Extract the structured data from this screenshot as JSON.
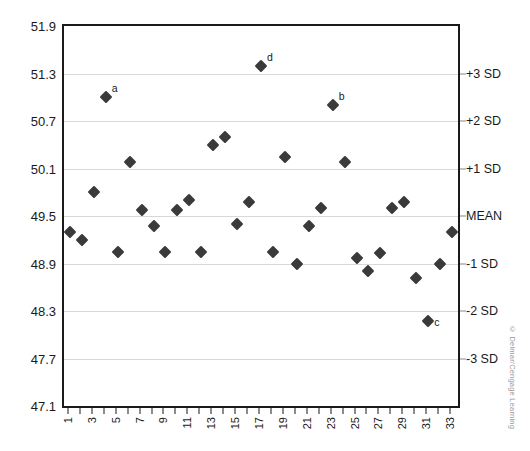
{
  "chart_data": {
    "type": "scatter",
    "title": "",
    "subtitle": "",
    "xlabel": "",
    "ylabel": "",
    "grid": true,
    "legend_position": "none",
    "xlim": [
      0.5,
      33.5
    ],
    "ylim": [
      47.1,
      51.9
    ],
    "y_left_ticks": [
      "51.9",
      "51.3",
      "50.7",
      "50.1",
      "49.5",
      "48.9",
      "48.3",
      "47.7",
      "47.1"
    ],
    "y_left_tick_values": [
      51.9,
      51.3,
      50.7,
      50.1,
      49.5,
      48.9,
      48.3,
      47.7,
      47.1
    ],
    "y_right_ticks": [
      "+3 SD",
      "+2 SD",
      "+1 SD",
      "MEAN",
      "-1 SD",
      "-2 SD",
      "-3 SD"
    ],
    "y_right_tick_values": [
      51.3,
      50.7,
      50.1,
      49.5,
      48.9,
      48.3,
      47.7
    ],
    "mean": 49.5,
    "sd": 0.6,
    "x": [
      1,
      2,
      3,
      4,
      5,
      6,
      7,
      8,
      9,
      10,
      11,
      12,
      13,
      14,
      15,
      16,
      17,
      18,
      19,
      20,
      21,
      22,
      23,
      24,
      25,
      26,
      27,
      28,
      29,
      30,
      31,
      32,
      33
    ],
    "x_tick_labels": [
      "1",
      "",
      "3",
      "",
      "5",
      "",
      "7",
      "",
      "9",
      "",
      "11",
      "",
      "13",
      "",
      "15",
      "",
      "17",
      "",
      "19",
      "",
      "21",
      "",
      "23",
      "",
      "25",
      "",
      "27",
      "",
      "29",
      "",
      "31",
      "",
      "33"
    ],
    "values": [
      49.3,
      49.2,
      49.8,
      51.0,
      49.05,
      50.18,
      49.57,
      49.38,
      49.05,
      49.58,
      49.7,
      49.05,
      50.4,
      50.5,
      49.4,
      49.68,
      51.4,
      49.05,
      50.25,
      48.9,
      49.38,
      49.6,
      50.9,
      50.18,
      48.97,
      48.8,
      49.03,
      49.6,
      49.68,
      48.72,
      48.18,
      48.9,
      49.3
    ],
    "point_labels": [
      {
        "index": 4,
        "x": 4,
        "value": 51.0,
        "label": "a"
      },
      {
        "index": 23,
        "x": 23,
        "value": 50.9,
        "label": "b"
      },
      {
        "index": 31,
        "x": 31,
        "value": 48.18,
        "label": "c"
      },
      {
        "index": 17,
        "x": 17,
        "value": 51.4,
        "label": "d"
      }
    ],
    "marker": "diamond",
    "marker_color": "#3a3a3a"
  },
  "footer": {
    "copyright": "© Delmar/Cengage Learning"
  }
}
